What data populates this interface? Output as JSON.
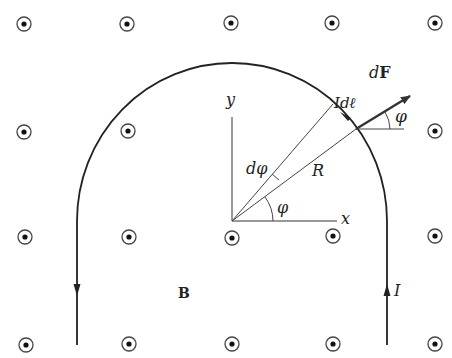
{
  "diagram": {
    "labels": {
      "dF": "dF",
      "dF_d": "d",
      "dF_F": "F",
      "Idl_I": "I",
      "Idl_d": "d",
      "Idl_l": "ℓ",
      "phi_top": "φ",
      "phi_center": "φ",
      "dphi": "dφ",
      "R": "R",
      "x_axis": "x",
      "y_axis": "y",
      "B": "B",
      "I": "I"
    },
    "field": {
      "symbol": "dot-in-circle",
      "meaning": "magnetic field out of page",
      "grid_x": [
        24,
        128,
        232,
        333,
        435
      ],
      "grid_y": [
        24,
        132,
        237,
        344
      ]
    },
    "geometry": {
      "center": [
        232,
        221
      ],
      "radius": 155,
      "element_angle_deg": 36.6,
      "dphi_angle_deg": 49
    },
    "colors": {
      "line": "#222222",
      "background": "#ffffff"
    }
  }
}
